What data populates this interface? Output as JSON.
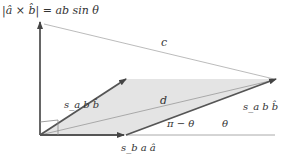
{
  "diagram": {
    "title_formula": "|â × b̂| = ab sin θ",
    "labels": {
      "c": "c",
      "d": "d",
      "sa_b_b": "s_a b b̂",
      "sb_a_a": "s_b a â",
      "pi_minus_theta": "π − θ",
      "theta": "θ"
    },
    "colors": {
      "vector_stroke": "#555555",
      "thin_line": "#999999",
      "fill_region": "#e0e0e0",
      "baseline": "#aaaaaa"
    },
    "points": {
      "origin": [
        40,
        135
      ],
      "top": [
        40,
        20
      ],
      "a_tip": [
        126,
        135
      ],
      "b_tip": [
        126,
        79
      ],
      "far_tip": [
        276,
        79
      ],
      "baseline_end": [
        275,
        135
      ]
    }
  }
}
